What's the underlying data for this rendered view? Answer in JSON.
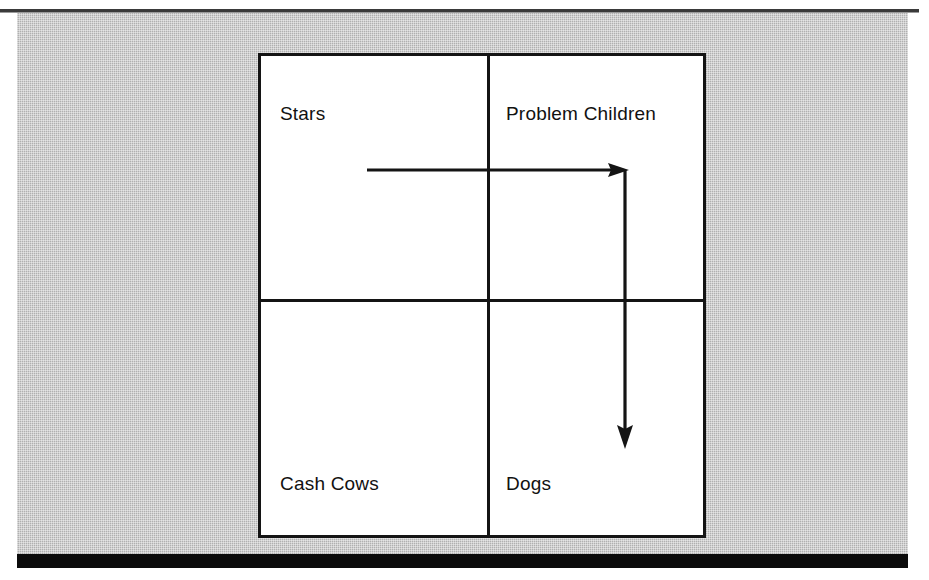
{
  "figure": {
    "type": "bcg-growth-share-matrix",
    "background_color": "#b9b9b9",
    "panel_color": "#ffffff",
    "line_color": "#141414"
  },
  "matrix": {
    "quadrants": [
      {
        "id": "stars",
        "label": "Stars",
        "position": "top-left"
      },
      {
        "id": "problem-children",
        "label": "Problem Children",
        "position": "top-right"
      },
      {
        "id": "cash-cows",
        "label": "Cash Cows",
        "position": "bottom-left"
      },
      {
        "id": "dogs",
        "label": "Dogs",
        "position": "bottom-right"
      }
    ]
  },
  "annotations": {
    "arrow": {
      "name": "migration-arrow",
      "description": "Right-then-down path from Stars into Dogs",
      "segments": [
        {
          "from": "stars",
          "to": "problem-children",
          "direction": "right"
        },
        {
          "from": "problem-children",
          "to": "dogs",
          "direction": "down"
        }
      ]
    }
  }
}
